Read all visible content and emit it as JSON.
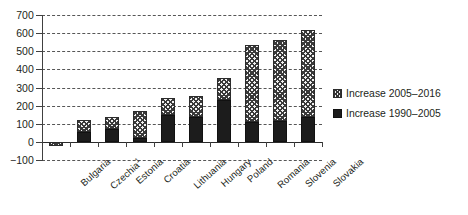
{
  "chart_data": {
    "type": "bar",
    "stacked": true,
    "title": "",
    "xlabel": "",
    "ylabel": "",
    "ylim": [
      -100,
      700
    ],
    "ytick_step": 100,
    "yticks": [
      700,
      600,
      500,
      400,
      300,
      200,
      100,
      0,
      -100
    ],
    "grid": true,
    "legend_position": "right",
    "categories": [
      "Bulgaria",
      "Czechia",
      "Estonia",
      "Croatia",
      "Lithuania",
      "Hungary",
      "Poland",
      "Romania",
      "Slovenia",
      "Slovakia"
    ],
    "category_footnotes": {
      "Czechia": "1"
    },
    "series": [
      {
        "name": "Increase 1990–2005",
        "pattern": "solid-black",
        "color": "#1c1c1c",
        "values": [
          0,
          55,
          70,
          20,
          150,
          140,
          230,
          110,
          115,
          140
        ]
      },
      {
        "name": "Increase 2005–2016",
        "pattern": "cross-hatch",
        "color": "#f2f2f2",
        "values": [
          -20,
          65,
          65,
          150,
          90,
          115,
          120,
          425,
          445,
          475
        ]
      }
    ],
    "totals": [
      -20,
      120,
      135,
      170,
      240,
      255,
      350,
      535,
      560,
      615
    ]
  },
  "legend": {
    "items": [
      {
        "label": "Increase 2005–2016",
        "swatch": "hatch"
      },
      {
        "label": "Increase 1990–2005",
        "swatch": "solid"
      }
    ]
  }
}
